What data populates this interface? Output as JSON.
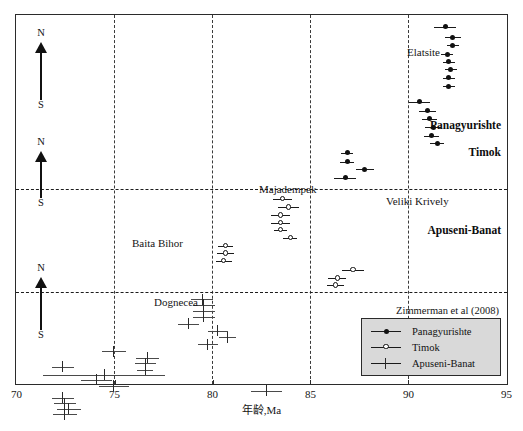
{
  "figure": {
    "source_note": "Zimmerman et al (2008)",
    "xlabel": "年龄,Ma",
    "colors": {
      "axis": "#2b2b2b",
      "marker": "#111111",
      "legend_bg": "#d9d9d9"
    }
  },
  "axis": {
    "ticks": [
      "70",
      "75",
      "80",
      "85",
      "90",
      "95"
    ],
    "tick_values": [
      70,
      75,
      80,
      85,
      90,
      95
    ]
  },
  "compass": {
    "north": "N",
    "south": "S"
  },
  "regions": [
    {
      "name": "Panagyurishte"
    },
    {
      "name": "Timok"
    },
    {
      "name": "Apuseni-Banat"
    }
  ],
  "deposit_labels": [
    {
      "text": "Elatsite"
    },
    {
      "text": "Majadempek"
    },
    {
      "text": "Veliki Krively"
    },
    {
      "text": "Baita Bihor"
    },
    {
      "text": "Dognecea"
    }
  ],
  "legend": {
    "items": [
      {
        "label": "Panagyurishte",
        "marker": "filled-circle"
      },
      {
        "label": "Timok",
        "marker": "open-circle"
      },
      {
        "label": "Apuseni-Banat",
        "marker": "cross-tick"
      }
    ]
  },
  "chart_data": {
    "type": "scatter",
    "title": "",
    "subtitle": "",
    "xlabel": "年龄,Ma",
    "ylabel": "",
    "xlim": [
      70,
      95
    ],
    "ylim": [
      0,
      1
    ],
    "grid": "vertical-dashed-at-x-ticks",
    "legend_position": "bottom-right",
    "annotations": [
      "Zimmerman et al (2008)",
      "Elatsite",
      "Majadempek",
      "Veliki Krively",
      "Baita Bihor",
      "Dognecea",
      "Panagyurishte",
      "Timok",
      "Apuseni-Banat"
    ],
    "series": [
      {
        "name": "Panagyurishte",
        "marker": "filled-circle",
        "points": [
          {
            "x": 91.9,
            "xerr": 0.55,
            "y": 0.968
          },
          {
            "x": 92.3,
            "xerr": 0.4,
            "y": 0.939
          },
          {
            "x": 92.3,
            "xerr": 0.3,
            "y": 0.918
          },
          {
            "x": 92.0,
            "xerr": 0.3,
            "y": 0.893
          },
          {
            "x": 92.1,
            "xerr": 0.3,
            "y": 0.873
          },
          {
            "x": 92.2,
            "xerr": 0.3,
            "y": 0.852
          },
          {
            "x": 92.1,
            "xerr": 0.3,
            "y": 0.83
          },
          {
            "x": 92.1,
            "xerr": 0.3,
            "y": 0.806
          },
          {
            "x": 90.6,
            "xerr": 0.55,
            "y": 0.764
          },
          {
            "x": 91.0,
            "xerr": 0.45,
            "y": 0.74
          },
          {
            "x": 91.1,
            "xerr": 0.4,
            "y": 0.718
          },
          {
            "x": 91.3,
            "xerr": 0.4,
            "y": 0.695
          },
          {
            "x": 91.2,
            "xerr": 0.4,
            "y": 0.672
          },
          {
            "x": 91.5,
            "xerr": 0.35,
            "y": 0.651
          },
          {
            "x": 86.9,
            "xerr": 0.3,
            "y": 0.625
          },
          {
            "x": 86.9,
            "xerr": 0.35,
            "y": 0.601
          },
          {
            "x": 87.8,
            "xerr": 0.45,
            "y": 0.58
          },
          {
            "x": 86.8,
            "xerr": 0.55,
            "y": 0.558
          }
        ]
      },
      {
        "name": "Timok",
        "marker": "open-circle",
        "points": [
          {
            "x": 83.6,
            "xerr": 0.5,
            "y": 0.5
          },
          {
            "x": 83.9,
            "xerr": 0.55,
            "y": 0.477
          },
          {
            "x": 83.5,
            "xerr": 0.5,
            "y": 0.455
          },
          {
            "x": 83.5,
            "xerr": 0.5,
            "y": 0.435
          },
          {
            "x": 83.5,
            "xerr": 0.35,
            "y": 0.415
          },
          {
            "x": 84.0,
            "xerr": 0.35,
            "y": 0.394
          },
          {
            "x": 80.7,
            "xerr": 0.4,
            "y": 0.372
          },
          {
            "x": 80.7,
            "xerr": 0.45,
            "y": 0.352
          },
          {
            "x": 80.6,
            "xerr": 0.4,
            "y": 0.332
          },
          {
            "x": 87.2,
            "xerr": 0.55,
            "y": 0.307
          },
          {
            "x": 86.4,
            "xerr": 0.45,
            "y": 0.284
          },
          {
            "x": 86.3,
            "xerr": 0.45,
            "y": 0.265
          }
        ]
      },
      {
        "name": "Apuseni-Banat",
        "marker": "cross-tick",
        "points": [
          {
            "x": 79.5,
            "xerr": 0.55,
            "y": 0.227
          },
          {
            "x": 79.6,
            "xerr": 0.55,
            "y": 0.212
          },
          {
            "x": 79.6,
            "xerr": 0.55,
            "y": 0.196
          },
          {
            "x": 79.6,
            "xerr": 0.55,
            "y": 0.18
          },
          {
            "x": 78.8,
            "xerr": 0.55,
            "y": 0.16
          },
          {
            "x": 80.3,
            "xerr": 0.5,
            "y": 0.142
          },
          {
            "x": 80.8,
            "xerr": 0.45,
            "y": 0.124
          },
          {
            "x": 79.8,
            "xerr": 0.5,
            "y": 0.105
          },
          {
            "x": 75.0,
            "xerr": 0.6,
            "y": 0.086
          },
          {
            "x": 76.7,
            "xerr": 0.6,
            "y": 0.068
          },
          {
            "x": 76.6,
            "xerr": 0.55,
            "y": 0.053
          },
          {
            "x": 72.4,
            "xerr": 0.55,
            "y": 0.044
          },
          {
            "x": 76.6,
            "xerr": 0.4,
            "y": 0.036
          },
          {
            "x": 74.5,
            "xerr": 3.1,
            "y": 0.022
          },
          {
            "x": 74.1,
            "xerr": 0.8,
            "y": 0.008
          },
          {
            "x": 75.0,
            "xerr": 0.75,
            "y": -0.008
          },
          {
            "x": 82.8,
            "xerr": 0.8,
            "y": -0.022
          },
          {
            "x": 72.4,
            "xerr": 0.55,
            "y": -0.04
          },
          {
            "x": 72.5,
            "xerr": 0.55,
            "y": -0.055
          },
          {
            "x": 72.7,
            "xerr": 0.6,
            "y": -0.07
          },
          {
            "x": 72.5,
            "xerr": 0.6,
            "y": -0.085
          }
        ]
      }
    ]
  }
}
